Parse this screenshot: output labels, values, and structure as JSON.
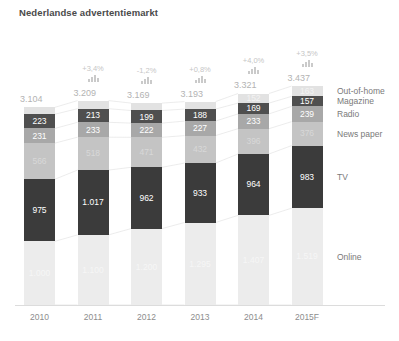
{
  "chart": {
    "title": "Nederlandse advertentiemarkt"
  },
  "chart_data": {
    "type": "bar",
    "subtype": "stacked-bar",
    "title": "Nederlandse advertentiemarkt",
    "xlabel": "",
    "ylabel": "",
    "grid": false,
    "legend_position": "right",
    "categories": [
      "2010",
      "2011",
      "2012",
      "2013",
      "2014",
      "2015F"
    ],
    "totals": [
      "3.104",
      "3.209",
      "3.169",
      "3.193",
      "3.321",
      "3.437"
    ],
    "totals_numeric": [
      3104,
      3209,
      3169,
      3193,
      3321,
      3437
    ],
    "growth_labels": [
      "",
      "+3,4%",
      "-1,2%",
      "+0,8%",
      "+4,0%",
      "+3,5%"
    ],
    "series": [
      {
        "name": "Out-of-home",
        "color": "#e2e2e2",
        "values": [
          109,
          128,
          115,
          118,
          152,
          163
        ],
        "labels": [
          "109",
          "128",
          "115",
          "118",
          "152",
          "163"
        ]
      },
      {
        "name": "Magazine",
        "color": "#4f4f4f",
        "values": [
          223,
          213,
          199,
          188,
          169,
          157
        ],
        "labels": [
          "223",
          "213",
          "199",
          "188",
          "169",
          "157"
        ]
      },
      {
        "name": "Radio",
        "color": "#a8a8a8",
        "values": [
          231,
          233,
          222,
          227,
          233,
          239
        ],
        "labels": [
          "231",
          "233",
          "222",
          "227",
          "233",
          "239"
        ]
      },
      {
        "name": "News paper",
        "color": "#c4c4c4",
        "values": [
          566,
          518,
          471,
          432,
          396,
          376
        ],
        "labels": [
          "566",
          "518",
          "471",
          "432",
          "396",
          "376"
        ]
      },
      {
        "name": "TV",
        "color": "#3b3b3b",
        "values": [
          975,
          1017,
          962,
          933,
          964,
          983
        ],
        "labels": [
          "975",
          "1.017",
          "962",
          "933",
          "964",
          "983"
        ]
      },
      {
        "name": "Online",
        "color": "#ececec",
        "values": [
          1000,
          1100,
          1200,
          1295,
          1407,
          1519
        ],
        "labels": [
          "1.000",
          "1.100",
          "1.200",
          "1.295",
          "1.407",
          "1.519"
        ]
      }
    ]
  },
  "legend": {
    "items": [
      {
        "label": "Out-of-home"
      },
      {
        "label": "Magazine"
      },
      {
        "label": "Radio"
      },
      {
        "label": "News paper"
      },
      {
        "label": "TV"
      },
      {
        "label": "Online"
      }
    ]
  }
}
